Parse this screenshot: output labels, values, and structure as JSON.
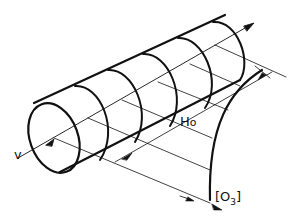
{
  "diagram": {
    "type": "technical-drawing",
    "labels": {
      "velocity": "v",
      "height_main": "H",
      "height_sub": "o",
      "surface_open": "[O",
      "surface_sub": "3",
      "surface_close": "]"
    },
    "colors": {
      "stroke": "#111111",
      "background": "#ffffff"
    }
  }
}
